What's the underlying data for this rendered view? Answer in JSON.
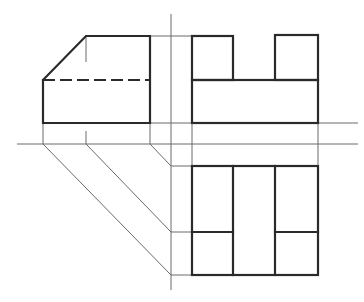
{
  "diagram": {
    "type": "orthographic-projection",
    "colors": {
      "background": "#ffffff",
      "visible_edge": "#2a2a2a",
      "construction_line": "#6a6a6a"
    },
    "views": [
      {
        "name": "front-view",
        "features": [
          "chamfered top-left corner",
          "hidden edge (dashed)"
        ]
      },
      {
        "name": "side-view",
        "features": [
          "base block",
          "two raised tabs"
        ]
      },
      {
        "name": "top-view",
        "features": [
          "three vertical divisions",
          "two lower cells"
        ]
      }
    ],
    "construction": [
      "horizontal reference axis",
      "vertical reference axis",
      "45-degree transfer lines"
    ]
  }
}
